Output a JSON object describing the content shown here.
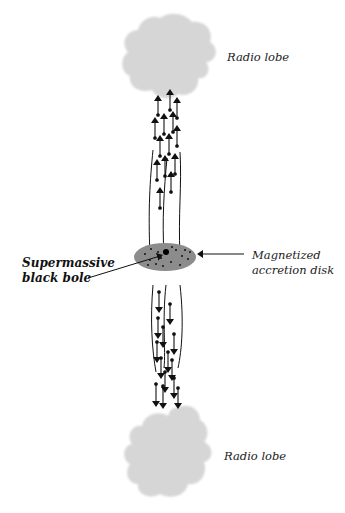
{
  "diagram": {
    "type": "radio-galaxy-schematic",
    "labels": {
      "top_lobe": "Radio lobe",
      "bottom_lobe": "Radio lobe",
      "black_hole_line1": "Supermassive",
      "black_hole_line2": "black bole",
      "disk_line1": "Magnetized",
      "disk_line2": "accretion disk"
    },
    "colors": {
      "lobe_fill": "#d6d6d6",
      "disk_fill": "#8c8c8c",
      "ink": "#111111",
      "background": "#ffffff"
    },
    "components": [
      {
        "name": "Radio lobe",
        "position": "top"
      },
      {
        "name": "Jet (upward arrows)",
        "direction": "up"
      },
      {
        "name": "Magnetized accretion disk",
        "position": "center"
      },
      {
        "name": "Supermassive black hole",
        "position": "disk center"
      },
      {
        "name": "Jet (downward arrows)",
        "direction": "down"
      },
      {
        "name": "Radio lobe",
        "position": "bottom"
      }
    ]
  }
}
